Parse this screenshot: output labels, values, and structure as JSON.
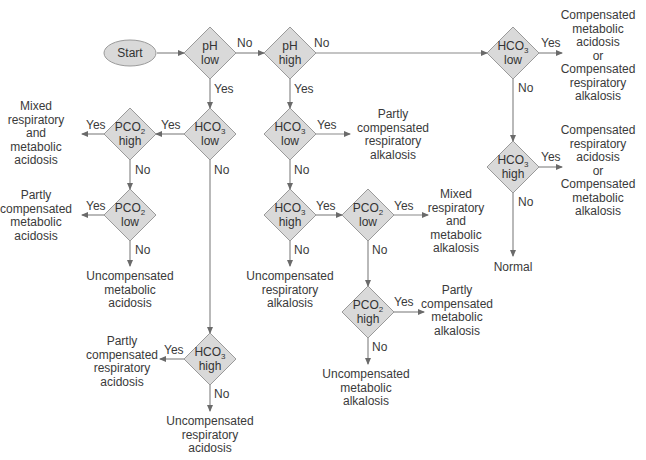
{
  "diagram": {
    "colors": {
      "node_fill": "#d9d9d9",
      "node_stroke": "#9a9a9a",
      "line": "#8a8a8a",
      "text": "#3a3a3a"
    },
    "start": {
      "id": "start",
      "label": "Start",
      "x": 130,
      "y": 53
    },
    "decisions": [
      {
        "id": "ph_low",
        "line1": "pH",
        "sub": "",
        "line2": "low",
        "x": 210,
        "y": 53
      },
      {
        "id": "ph_high",
        "line1": "pH",
        "sub": "",
        "line2": "high",
        "x": 290,
        "y": 53
      },
      {
        "id": "hco3_low_r",
        "line1": "HCO",
        "sub": "3",
        "line2": "low",
        "x": 513,
        "y": 53
      },
      {
        "id": "hco3_high_r",
        "line1": "HCO",
        "sub": "3",
        "line2": "high",
        "x": 513,
        "y": 167
      },
      {
        "id": "hco3_low_l",
        "line1": "HCO",
        "sub": "3",
        "line2": "low",
        "x": 210,
        "y": 134
      },
      {
        "id": "pco2_high_l",
        "line1": "PCO",
        "sub": "2",
        "line2": "high",
        "x": 130,
        "y": 134
      },
      {
        "id": "pco2_low_l",
        "line1": "PCO",
        "sub": "2",
        "line2": "low",
        "x": 130,
        "y": 215
      },
      {
        "id": "hco3_low_m",
        "line1": "HCO",
        "sub": "3",
        "line2": "low",
        "x": 290,
        "y": 134
      },
      {
        "id": "hco3_high_m",
        "line1": "HCO",
        "sub": "3",
        "line2": "high",
        "x": 290,
        "y": 215
      },
      {
        "id": "pco2_low_m",
        "line1": "PCO",
        "sub": "2",
        "line2": "low",
        "x": 368,
        "y": 215
      },
      {
        "id": "pco2_high_m",
        "line1": "PCO",
        "sub": "2",
        "line2": "high",
        "x": 368,
        "y": 312
      },
      {
        "id": "hco3_high_b",
        "line1": "HCO",
        "sub": "3",
        "line2": "high",
        "x": 210,
        "y": 359
      }
    ],
    "outcomes": [
      {
        "id": "o1",
        "text": "Compensated\nmetabolic\nacidosis\nor\nCompensated\nrespiratory\nalkalosis",
        "x": 598,
        "y": 9
      },
      {
        "id": "o2",
        "text": "Compensated\nrespiratory\nacidosis\nor\nCompensated\nmetabolic\nalkalosis",
        "x": 598,
        "y": 124
      },
      {
        "id": "o3",
        "text": "Normal",
        "x": 513,
        "y": 261
      },
      {
        "id": "o4",
        "text": "Mixed\nrespiratory\nand\nmetabolic\nacidosis",
        "x": 36,
        "y": 100
      },
      {
        "id": "o5",
        "text": "Partly\ncompensated\nmetabolic\nacidosis",
        "x": 36,
        "y": 189
      },
      {
        "id": "o6",
        "text": "Uncompensated\nmetabolic\nacidosis",
        "x": 130,
        "y": 270
      },
      {
        "id": "o7",
        "text": "Partly\ncompensated\nrespiratory\nalkalosis",
        "x": 393,
        "y": 108
      },
      {
        "id": "o8",
        "text": "Uncompensated\nrespiratory\nalkalosis",
        "x": 290,
        "y": 270
      },
      {
        "id": "o9",
        "text": "Mixed\nrespiratory\nand\nmetabolic\nalkalosis",
        "x": 456,
        "y": 188
      },
      {
        "id": "o10",
        "text": "Partly\ncompensated\nmetabolic\nalkalosis",
        "x": 457,
        "y": 284
      },
      {
        "id": "o11",
        "text": "Uncompensated\nmetabolic\nalkalosis",
        "x": 366,
        "y": 368
      },
      {
        "id": "o12",
        "text": "Partly\ncompensated\nrespiratory\nacidosis",
        "x": 122,
        "y": 335
      },
      {
        "id": "o13",
        "text": "Uncompensated\nrespiratory\nacidosis",
        "x": 210,
        "y": 415
      }
    ],
    "edges": [
      {
        "pts": [
          [
            157,
            53
          ],
          [
            184,
            53
          ]
        ],
        "label": "",
        "lx": 0,
        "ly": 0
      },
      {
        "pts": [
          [
            236,
            53
          ],
          [
            264,
            53
          ]
        ],
        "label": "No",
        "lx": 237,
        "ly": 36
      },
      {
        "pts": [
          [
            316,
            53
          ],
          [
            487,
            53
          ]
        ],
        "label": "No",
        "lx": 314,
        "ly": 36
      },
      {
        "pts": [
          [
            539,
            53
          ],
          [
            562,
            53
          ]
        ],
        "label": "Yes",
        "lx": 541,
        "ly": 36
      },
      {
        "pts": [
          [
            513,
            79
          ],
          [
            513,
            141
          ]
        ],
        "label": "No",
        "lx": 518,
        "ly": 81
      },
      {
        "pts": [
          [
            539,
            167
          ],
          [
            562,
            167
          ]
        ],
        "label": "Yes",
        "lx": 541,
        "ly": 150
      },
      {
        "pts": [
          [
            513,
            193
          ],
          [
            513,
            256
          ]
        ],
        "label": "No",
        "lx": 518,
        "ly": 195
      },
      {
        "pts": [
          [
            210,
            79
          ],
          [
            210,
            108
          ]
        ],
        "label": "Yes",
        "lx": 214,
        "ly": 82
      },
      {
        "pts": [
          [
            184,
            134
          ],
          [
            156,
            134
          ]
        ],
        "label": "Yes",
        "lx": 161,
        "ly": 118
      },
      {
        "pts": [
          [
            104,
            134
          ],
          [
            82,
            134
          ]
        ],
        "label": "Yes",
        "lx": 86,
        "ly": 118
      },
      {
        "pts": [
          [
            130,
            160
          ],
          [
            130,
            189
          ]
        ],
        "label": "No",
        "lx": 135,
        "ly": 163
      },
      {
        "pts": [
          [
            104,
            215
          ],
          [
            82,
            215
          ]
        ],
        "label": "Yes",
        "lx": 86,
        "ly": 199
      },
      {
        "pts": [
          [
            130,
            241
          ],
          [
            130,
            266
          ]
        ],
        "label": "No",
        "lx": 135,
        "ly": 243
      },
      {
        "pts": [
          [
            210,
            160
          ],
          [
            210,
            333
          ]
        ],
        "label": "No",
        "lx": 214,
        "ly": 163
      },
      {
        "pts": [
          [
            184,
            359
          ],
          [
            160,
            359
          ]
        ],
        "label": "Yes",
        "lx": 164,
        "ly": 343
      },
      {
        "pts": [
          [
            210,
            385
          ],
          [
            210,
            411
          ]
        ],
        "label": "No",
        "lx": 214,
        "ly": 387
      },
      {
        "pts": [
          [
            290,
            79
          ],
          [
            290,
            108
          ]
        ],
        "label": "Yes",
        "lx": 294,
        "ly": 82
      },
      {
        "pts": [
          [
            316,
            134
          ],
          [
            350,
            134
          ]
        ],
        "label": "Yes",
        "lx": 317,
        "ly": 118
      },
      {
        "pts": [
          [
            290,
            160
          ],
          [
            290,
            189
          ]
        ],
        "label": "No",
        "lx": 294,
        "ly": 163
      },
      {
        "pts": [
          [
            316,
            215
          ],
          [
            342,
            215
          ]
        ],
        "label": "Yes",
        "lx": 316,
        "ly": 199
      },
      {
        "pts": [
          [
            290,
            241
          ],
          [
            290,
            266
          ]
        ],
        "label": "No",
        "lx": 294,
        "ly": 243
      },
      {
        "pts": [
          [
            394,
            215
          ],
          [
            428,
            215
          ]
        ],
        "label": "Yes",
        "lx": 394,
        "ly": 199
      },
      {
        "pts": [
          [
            368,
            241
          ],
          [
            368,
            286
          ]
        ],
        "label": "No",
        "lx": 372,
        "ly": 243
      },
      {
        "pts": [
          [
            394,
            312
          ],
          [
            424,
            312
          ]
        ],
        "label": "Yes",
        "lx": 394,
        "ly": 295
      },
      {
        "pts": [
          [
            368,
            338
          ],
          [
            368,
            364
          ]
        ],
        "label": "No",
        "lx": 372,
        "ly": 340
      }
    ]
  }
}
